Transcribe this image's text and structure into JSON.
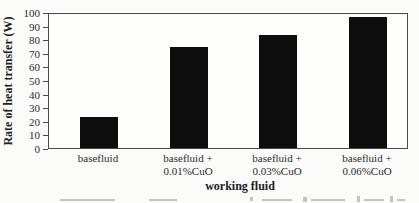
{
  "chart_data": {
    "type": "bar",
    "title": "",
    "xlabel": "working fluid",
    "ylabel": "Rate of heat transfer (W)",
    "categories": [
      {
        "line1": "basefluid",
        "line2": ""
      },
      {
        "line1": "basefluid +",
        "line2": "0.01%CuO"
      },
      {
        "line1": "basefluid +",
        "line2": "0.03%CuO"
      },
      {
        "line1": "basefluid +",
        "line2": "0.06%CuO"
      }
    ],
    "values": [
      23,
      74,
      83,
      96
    ],
    "ylim": [
      0,
      100
    ],
    "ytick_step": 10,
    "grid": false,
    "legend": "none",
    "colors": {
      "bar": "#0d0d0d",
      "axis": "#4a4a4a",
      "text": "#262626",
      "background": "#fbfbfa"
    }
  }
}
